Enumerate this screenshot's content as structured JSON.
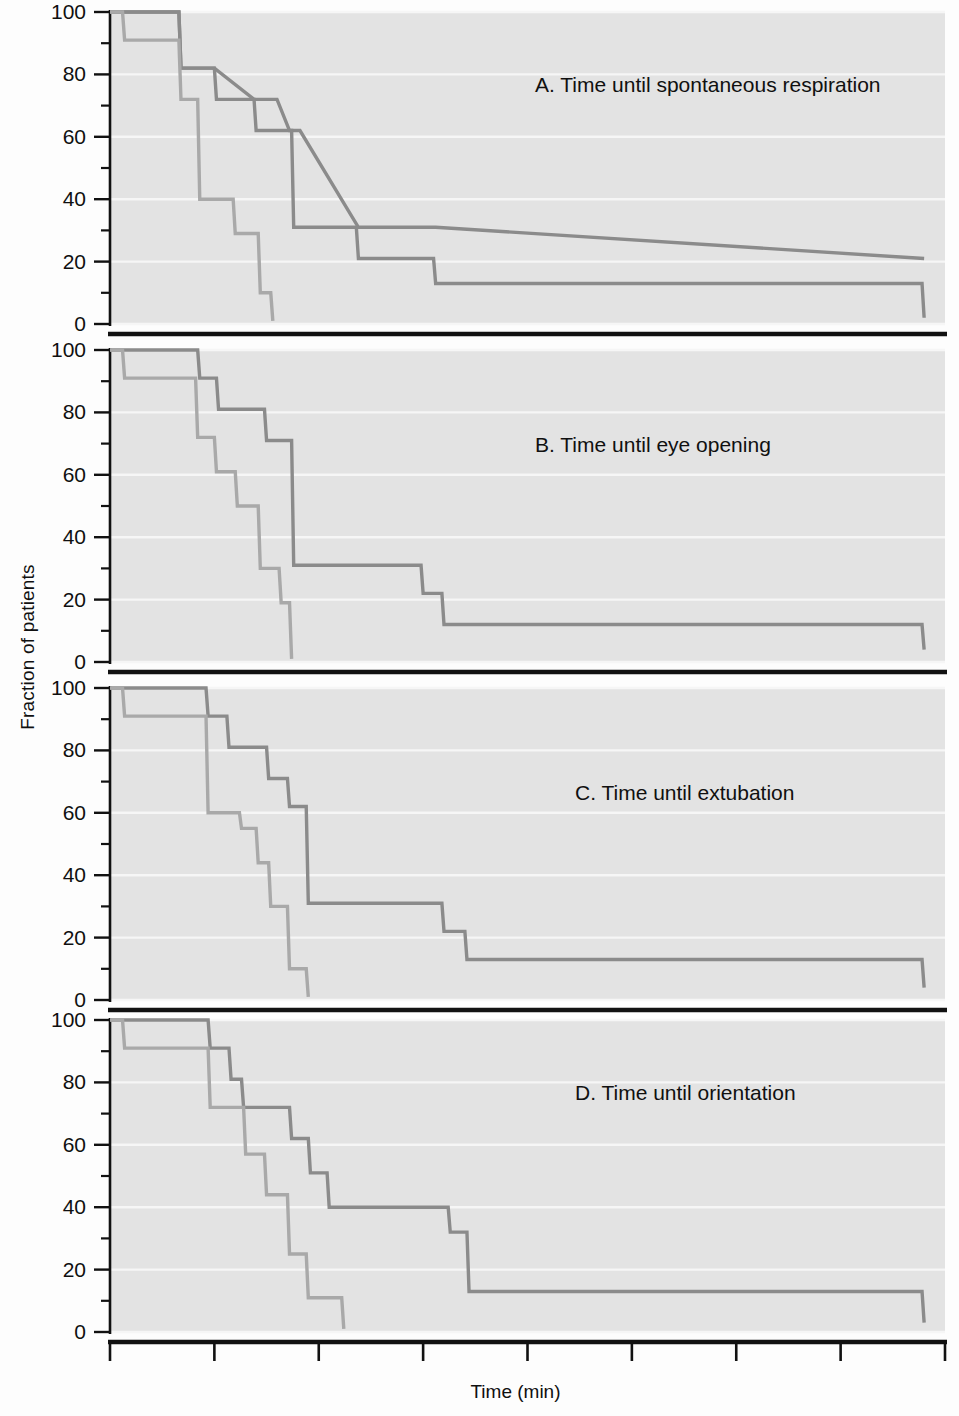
{
  "figure": {
    "y_axis_title": "Fraction of patients",
    "x_axis_title": "Time (min)",
    "y_ticks": [
      "0",
      "20",
      "40",
      "60",
      "80",
      "100"
    ],
    "x_ticks": [
      "0",
      "5",
      "10",
      "15",
      "20",
      "25",
      "30",
      "35",
      "40"
    ],
    "panel_labels": {
      "a": "A. Time until spontaneous respiration",
      "b": "B. Time until eye opening",
      "c": "C. Time until extubation",
      "d": "D. Time until orientation"
    },
    "colors": {
      "plot_background": "#e3e3e3",
      "gridline": "#f6f6f6",
      "axis": "#111111",
      "series_dark": "#8b8b8b",
      "series_light": "#a9a9a9",
      "text": "#101010"
    }
  },
  "chart_data": [
    {
      "type": "line",
      "step": "post",
      "title": "A. Time until spontaneous respiration",
      "xlabel": "Time (min)",
      "ylabel": "Fraction of patients",
      "xlim": [
        0,
        40
      ],
      "ylim": [
        0,
        100
      ],
      "xticks": [
        0,
        5,
        10,
        15,
        20,
        25,
        30,
        35,
        40
      ],
      "yticks": [
        0,
        20,
        40,
        60,
        80,
        100
      ],
      "minor_yticks": [
        10,
        30,
        50,
        70,
        90
      ],
      "grid": true,
      "legend": "none",
      "series": [
        {
          "name": "Group 1 (slow emergence)",
          "color": "#8b8b8b",
          "x": [
            0,
            3.3,
            3.4,
            5.0,
            6.9,
            8.0,
            8.6,
            9.1,
            11.9,
            15.6,
            39.0,
            39.0
          ],
          "y": [
            100,
            100,
            82,
            82,
            72,
            72,
            62,
            62,
            31,
            31,
            21,
            21
          ]
        },
        {
          "name": "Group 1 detailed steps",
          "color": "#8b8b8b",
          "x": [
            0,
            3.3,
            3.4,
            5.0,
            5.1,
            6.9,
            7.0,
            8.7,
            8.8,
            11.8,
            11.9,
            15.5,
            15.6,
            38.9,
            39.0
          ],
          "y": [
            100,
            100,
            82,
            82,
            72,
            72,
            62,
            62,
            31,
            31,
            21,
            21,
            13,
            13,
            2
          ]
        },
        {
          "name": "Group 2 (fast emergence)",
          "color": "#a9a9a9",
          "x": [
            0,
            0.6,
            0.7,
            3.3,
            3.4,
            4.2,
            4.3,
            5.9,
            6.0,
            7.1,
            7.2,
            7.7,
            7.8
          ],
          "y": [
            100,
            100,
            91,
            91,
            72,
            72,
            40,
            40,
            29,
            29,
            10,
            10,
            1
          ]
        }
      ]
    },
    {
      "type": "line",
      "step": "post",
      "title": "B. Time until eye opening",
      "xlabel": "Time (min)",
      "ylabel": "Fraction of patients",
      "xlim": [
        0,
        40
      ],
      "ylim": [
        0,
        100
      ],
      "xticks": [
        0,
        5,
        10,
        15,
        20,
        25,
        30,
        35,
        40
      ],
      "yticks": [
        0,
        20,
        40,
        60,
        80,
        100
      ],
      "minor_yticks": [
        10,
        30,
        50,
        70,
        90
      ],
      "grid": true,
      "legend": "none",
      "series": [
        {
          "name": "Group 1 (slow emergence)",
          "color": "#8b8b8b",
          "x": [
            0,
            4.2,
            4.3,
            5.1,
            5.2,
            7.4,
            7.5,
            8.7,
            8.8,
            14.9,
            15.0,
            15.9,
            16.0,
            38.9,
            39.0
          ],
          "y": [
            100,
            100,
            91,
            91,
            81,
            81,
            71,
            71,
            31,
            31,
            22,
            22,
            12,
            12,
            4
          ]
        },
        {
          "name": "Group 2 (fast emergence)",
          "color": "#a9a9a9",
          "x": [
            0,
            0.6,
            0.7,
            4.1,
            4.2,
            5.0,
            5.1,
            6.0,
            6.1,
            7.1,
            7.2,
            8.1,
            8.2,
            8.6,
            8.7
          ],
          "y": [
            100,
            100,
            91,
            91,
            72,
            72,
            61,
            61,
            50,
            50,
            30,
            30,
            19,
            19,
            1
          ]
        }
      ]
    },
    {
      "type": "line",
      "step": "post",
      "title": "C. Time until extubation",
      "xlabel": "Time (min)",
      "ylabel": "Fraction of patients",
      "xlim": [
        0,
        40
      ],
      "ylim": [
        0,
        100
      ],
      "xticks": [
        0,
        5,
        10,
        15,
        20,
        25,
        30,
        35,
        40
      ],
      "yticks": [
        0,
        20,
        40,
        60,
        80,
        100
      ],
      "minor_yticks": [
        10,
        30,
        50,
        70,
        90
      ],
      "grid": true,
      "legend": "none",
      "series": [
        {
          "name": "Group 1 (slow emergence)",
          "color": "#8b8b8b",
          "x": [
            0,
            4.6,
            4.7,
            5.6,
            5.7,
            7.5,
            7.6,
            8.5,
            8.6,
            9.4,
            9.5,
            15.9,
            16.0,
            17.0,
            17.1,
            38.9,
            39.0
          ],
          "y": [
            100,
            100,
            91,
            91,
            81,
            81,
            71,
            71,
            62,
            62,
            31,
            31,
            22,
            22,
            13,
            13,
            4
          ]
        },
        {
          "name": "Group 2 (fast emergence)",
          "color": "#a9a9a9",
          "x": [
            0,
            0.6,
            0.7,
            4.6,
            4.7,
            6.2,
            6.3,
            7.0,
            7.1,
            7.6,
            7.7,
            8.5,
            8.6,
            9.4,
            9.5
          ],
          "y": [
            100,
            100,
            91,
            91,
            60,
            60,
            55,
            55,
            44,
            44,
            30,
            30,
            10,
            10,
            1
          ]
        }
      ]
    },
    {
      "type": "line",
      "step": "post",
      "title": "D. Time until orientation",
      "xlabel": "Time (min)",
      "ylabel": "Fraction of patients",
      "xlim": [
        0,
        40
      ],
      "ylim": [
        0,
        100
      ],
      "xticks": [
        0,
        5,
        10,
        15,
        20,
        25,
        30,
        35,
        40
      ],
      "yticks": [
        0,
        20,
        40,
        60,
        80,
        100
      ],
      "minor_yticks": [
        10,
        30,
        50,
        70,
        90
      ],
      "grid": true,
      "legend": "none",
      "series": [
        {
          "name": "Group 1 (slow emergence)",
          "color": "#8b8b8b",
          "x": [
            0,
            4.7,
            4.8,
            5.7,
            5.8,
            6.3,
            6.4,
            8.6,
            8.7,
            9.5,
            9.6,
            10.4,
            10.5,
            16.2,
            16.3,
            17.1,
            17.2,
            38.9,
            39.0
          ],
          "y": [
            100,
            100,
            91,
            91,
            81,
            81,
            72,
            72,
            62,
            62,
            51,
            51,
            40,
            40,
            32,
            32,
            13,
            13,
            3
          ]
        },
        {
          "name": "Group 2 (fast emergence)",
          "color": "#a9a9a9",
          "x": [
            0,
            0.6,
            0.7,
            4.7,
            4.8,
            6.4,
            6.5,
            7.4,
            7.5,
            8.5,
            8.6,
            9.4,
            9.5,
            11.1,
            11.2
          ],
          "y": [
            100,
            100,
            91,
            91,
            72,
            72,
            57,
            57,
            44,
            44,
            25,
            25,
            11,
            11,
            1
          ]
        }
      ]
    }
  ]
}
